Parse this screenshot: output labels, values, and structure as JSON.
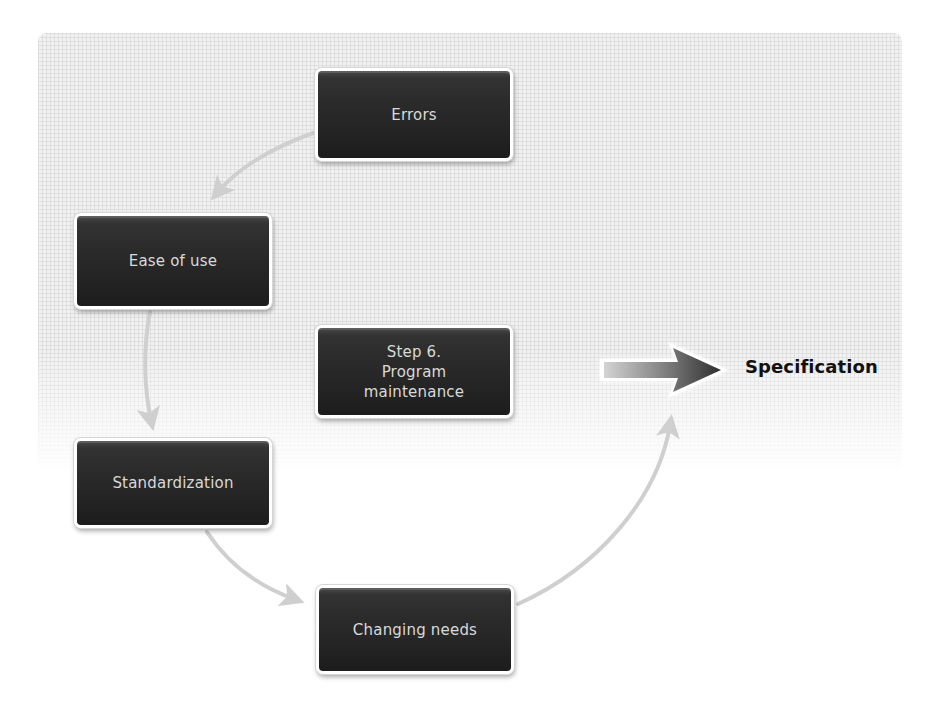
{
  "diagram": {
    "type": "cycle",
    "nodes": [
      {
        "id": "errors",
        "label": "Errors"
      },
      {
        "id": "ease_of_use",
        "label": "Ease of use"
      },
      {
        "id": "program_maintenance",
        "label": "Step 6.\nProgram\nmaintenance"
      },
      {
        "id": "standardization",
        "label": "Standardization"
      },
      {
        "id": "changing_needs",
        "label": "Changing needs"
      }
    ],
    "edges": [
      {
        "from": "errors",
        "to": "ease_of_use"
      },
      {
        "from": "ease_of_use",
        "to": "standardization"
      },
      {
        "from": "standardization",
        "to": "changing_needs"
      },
      {
        "from": "changing_needs",
        "to": "specification"
      }
    ],
    "output": {
      "label": "Specification",
      "arrow": "large-right-arrow"
    }
  },
  "colors": {
    "node_fill": "#262626",
    "node_text": "#d9d9d9",
    "connector": "#cfcfcf",
    "output_text": "#111111",
    "arrow_dark": "#3a3a3a",
    "arrow_light": "#c8c8c8",
    "grid_bg": "#f1f1f1"
  }
}
